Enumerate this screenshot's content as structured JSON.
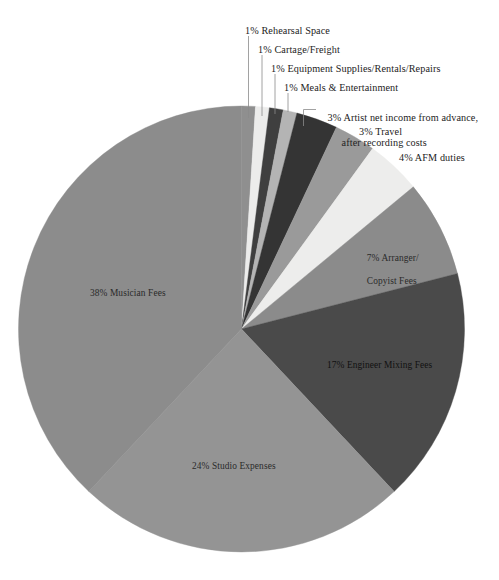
{
  "chart_data": {
    "type": "pie",
    "title": "",
    "subtitle": "",
    "xlabel": "",
    "ylabel": "",
    "legend_position": "none",
    "grid": false,
    "units": "percent",
    "start_angle_deg": 0,
    "direction": "clockwise",
    "total": 100,
    "categories": [
      "Rehearsal Space",
      "Cartage/Freight",
      "Equipment Supplies/Rentals/Repairs",
      "Meals & Entertainment",
      "Artist net income from advance, after recording costs",
      "Travel",
      "AFM duties",
      "Arranger/Copyist Fees",
      "Engineer Mixing Fees",
      "Studio Expenses",
      "Musician Fees"
    ],
    "values": [
      1,
      1,
      1,
      1,
      3,
      3,
      4,
      7,
      17,
      24,
      38
    ],
    "colors": [
      "#8f8f8f",
      "#ececeb",
      "#3f3f3f",
      "#b4b4b4",
      "#343434",
      "#9a9a9a",
      "#ededec",
      "#8b8b8b",
      "#4a4a4a",
      "#949494",
      "#8c8c8c"
    ],
    "slices": [
      {
        "label": "1% Rehearsal Space",
        "percent": 1,
        "category": "Rehearsal Space",
        "color": "#8f8f8f",
        "label_style": "callout"
      },
      {
        "label": "1% Cartage/Freight",
        "percent": 1,
        "category": "Cartage/Freight",
        "color": "#ececeb",
        "label_style": "callout"
      },
      {
        "label": "1% Equipment Supplies/Rentals/Repairs",
        "percent": 1,
        "category": "Equipment Supplies/Rentals/Repairs",
        "color": "#3f3f3f",
        "label_style": "callout"
      },
      {
        "label": "1% Meals & Entertainment",
        "percent": 1,
        "category": "Meals & Entertainment",
        "color": "#b4b4b4",
        "label_style": "callout"
      },
      {
        "label": "3% Artist net income from advance,",
        "label_line2": "after recording costs",
        "percent": 3,
        "category": "Artist net income from advance, after recording costs",
        "color": "#343434",
        "label_style": "callout-elbow"
      },
      {
        "label": "3% Travel",
        "percent": 3,
        "category": "Travel",
        "color": "#9a9a9a",
        "label_style": "outside"
      },
      {
        "label": "4% AFM duties",
        "percent": 4,
        "category": "AFM duties",
        "color": "#ededec",
        "label_style": "outside"
      },
      {
        "label": "7% Arranger/",
        "label_line2": "Copyist Fees",
        "percent": 7,
        "category": "Arranger/Copyist Fees",
        "color": "#8b8b8b",
        "label_style": "inside"
      },
      {
        "label": "17% Engineer Mixing Fees",
        "percent": 17,
        "category": "Engineer Mixing Fees",
        "color": "#4a4a4a",
        "label_style": "inside"
      },
      {
        "label": "24% Studio Expenses",
        "percent": 24,
        "category": "Studio Expenses",
        "color": "#949494",
        "label_style": "inside"
      },
      {
        "label": "38% Musician Fees",
        "percent": 38,
        "category": "Musician Fees",
        "color": "#8c8c8c",
        "label_style": "inside"
      }
    ]
  },
  "labels": {
    "rehearsal_space": "1% Rehearsal Space",
    "cartage_freight": "1% Cartage/Freight",
    "equipment": "1% Equipment Supplies/Rentals/Repairs",
    "meals": "1% Meals & Entertainment",
    "artist_line1": "3% Artist net income from advance,",
    "artist_line2": "after recording costs",
    "travel": "3% Travel",
    "afm": "4% AFM duties",
    "arranger_line1": "7% Arranger/",
    "arranger_line2": "Copyist Fees",
    "engineer": "17% Engineer Mixing Fees",
    "studio": "24% Studio Expenses",
    "musician": "38% Musician Fees"
  },
  "style": {
    "background": "#ffffff",
    "leader_line_color": "#8a8a8a",
    "text_color": "#2b2b2b"
  }
}
